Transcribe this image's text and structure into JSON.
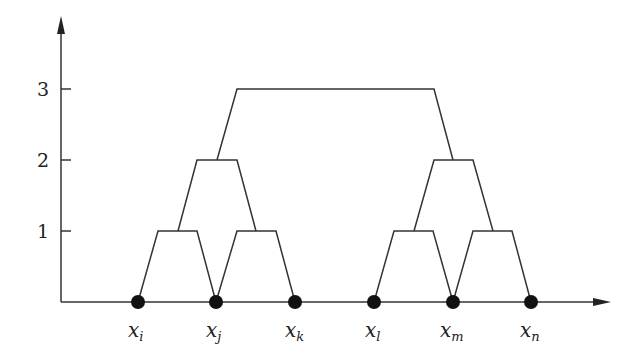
{
  "diagram": {
    "type": "dendrogram",
    "y_axis": {
      "ticks": [
        {
          "value": 1,
          "label": "1"
        },
        {
          "value": 2,
          "label": "2"
        },
        {
          "value": 3,
          "label": "3"
        }
      ]
    },
    "points": [
      {
        "id": "i",
        "base": "x",
        "sub": "i"
      },
      {
        "id": "j",
        "base": "x",
        "sub": "j"
      },
      {
        "id": "k",
        "base": "x",
        "sub": "k"
      },
      {
        "id": "l",
        "base": "x",
        "sub": "l"
      },
      {
        "id": "m",
        "base": "x",
        "sub": "m"
      },
      {
        "id": "n",
        "base": "x",
        "sub": "n"
      }
    ],
    "merges": [
      {
        "level": 1,
        "children": [
          "x_i",
          "x_j"
        ]
      },
      {
        "level": 1,
        "children": [
          "x_j",
          "x_k"
        ]
      },
      {
        "level": 1,
        "children": [
          "x_l",
          "x_m"
        ]
      },
      {
        "level": 1,
        "children": [
          "x_m",
          "x_n"
        ]
      },
      {
        "level": 2,
        "children": [
          "{x_i,x_j}",
          "{x_j,x_k}"
        ]
      },
      {
        "level": 2,
        "children": [
          "{x_l,x_m}",
          "{x_m,x_n}"
        ]
      },
      {
        "level": 3,
        "children": [
          "left cluster",
          "right cluster"
        ]
      }
    ],
    "colors": {
      "line": "#333333",
      "point": "#111111"
    }
  }
}
